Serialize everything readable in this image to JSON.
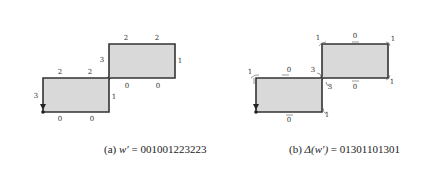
{
  "figures": [
    {
      "id": "a",
      "caption_prefix": "(a)",
      "caption_var": "w′",
      "caption_eq": " = 001001223223",
      "edge_labels": [
        {
          "text": "3",
          "x": 36,
          "y": 98
        },
        {
          "text": "2",
          "x": 60,
          "y": 74
        },
        {
          "text": "2",
          "x": 90,
          "y": 74
        },
        {
          "text": "1",
          "x": 114,
          "y": 99
        },
        {
          "text": "0",
          "x": 60,
          "y": 121
        },
        {
          "text": "0",
          "x": 92,
          "y": 121
        },
        {
          "text": "3",
          "x": 102,
          "y": 62
        },
        {
          "text": "2",
          "x": 126,
          "y": 40
        },
        {
          "text": "2",
          "x": 157,
          "y": 40
        },
        {
          "text": "1",
          "x": 180,
          "y": 63
        },
        {
          "text": "0",
          "x": 127,
          "y": 88
        },
        {
          "text": "0",
          "x": 158,
          "y": 88
        }
      ]
    },
    {
      "id": "b",
      "caption_prefix": "(b)",
      "caption_var": "Δ(w′)",
      "caption_eq": " = 01301101301",
      "edge_labels": [
        {
          "text": "1",
          "x": 250,
          "y": 74
        },
        {
          "text": "0",
          "x": 289,
          "y": 72
        },
        {
          "text": "3",
          "x": 313,
          "y": 72
        },
        {
          "text": "3",
          "x": 330,
          "y": 89
        },
        {
          "text": "0",
          "x": 355,
          "y": 89
        },
        {
          "text": "1",
          "x": 392,
          "y": 84
        },
        {
          "text": "1",
          "x": 318,
          "y": 40
        },
        {
          "text": "0",
          "x": 355,
          "y": 38
        },
        {
          "text": "1",
          "x": 393,
          "y": 41
        },
        {
          "text": "0",
          "x": 289,
          "y": 122
        },
        {
          "text": "1",
          "x": 327,
          "y": 117
        }
      ]
    }
  ]
}
